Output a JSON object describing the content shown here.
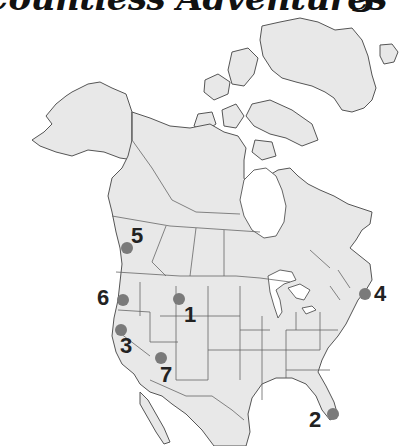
{
  "header": {
    "title": "Countless Adventures",
    "page_number": "3"
  },
  "map": {
    "region": "North America",
    "land_color": "#e8e8e8",
    "marker_color": "#7a7a7a",
    "markers": [
      {
        "label": "1",
        "location": "Wyoming / Utah area",
        "dot": [
          179,
          299
        ],
        "text": [
          184,
          304
        ]
      },
      {
        "label": "2",
        "location": "South Florida",
        "dot": [
          333,
          414
        ],
        "text": [
          309,
          409
        ]
      },
      {
        "label": "3",
        "location": "Northern California",
        "dot": [
          121,
          330
        ],
        "text": [
          120,
          335
        ]
      },
      {
        "label": "4",
        "location": "Massachusetts / New England",
        "dot": [
          365,
          294
        ],
        "text": [
          374,
          283
        ]
      },
      {
        "label": "5",
        "location": "British Columbia (Vancouver area)",
        "dot": [
          127,
          248
        ],
        "text": [
          131,
          225
        ]
      },
      {
        "label": "6",
        "location": "Oregon",
        "dot": [
          123,
          300
        ],
        "text": [
          97,
          287
        ]
      },
      {
        "label": "7",
        "location": "Arizona",
        "dot": [
          161,
          358
        ],
        "text": [
          160,
          364
        ]
      }
    ]
  }
}
